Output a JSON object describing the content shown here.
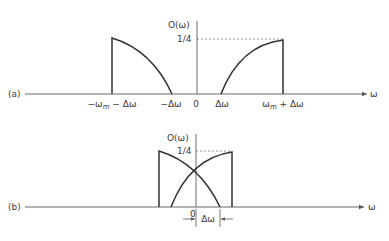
{
  "panel_a": {
    "label": "(a)",
    "y_axis_label": "O(ω)",
    "y_tick": "1/4",
    "x_axis_label": "ω",
    "x_ticks": [
      {
        "text": "−ω",
        "sub": "m",
        "rest": " − Δω"
      },
      {
        "text": "−Δω"
      },
      {
        "text": "0"
      },
      {
        "text": "Δω"
      },
      {
        "text": "ω",
        "sub": "m",
        "rest": " + Δω"
      }
    ]
  },
  "panel_b": {
    "label": "(b)",
    "y_axis_label": "O(ω)",
    "y_tick": "1/4",
    "x_axis_label": "ω",
    "origin": "0",
    "dimension_label": "Δω"
  }
}
